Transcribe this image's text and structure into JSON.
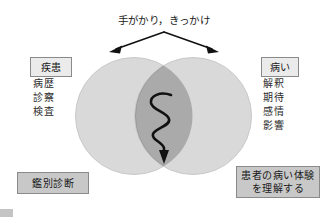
{
  "diagram": {
    "top_caption": "手がかり，きっかけ",
    "left": {
      "heading": "疾患",
      "items": [
        "病歴",
        "診察",
        "検査"
      ],
      "conclusion": "鑑別診断"
    },
    "right": {
      "heading": "病い",
      "items": [
        "解釈",
        "期待",
        "感情",
        "影響"
      ],
      "conclusion_line1": "患者の病い体験",
      "conclusion_line2": "を理解する"
    },
    "icons": {
      "left_arrow": "arrow-down-left-icon",
      "right_arrow": "arrow-down-right-icon",
      "squiggle_arrow": "squiggly-down-arrow-icon",
      "left_circle": "venn-circle-left-icon",
      "right_circle": "venn-circle-right-icon",
      "overlap": "venn-overlap-lens-icon"
    },
    "colors": {
      "circle_fill": "#d9d9d9",
      "overlap_fill": "#aaaaaa",
      "circle_stroke": "#c9c9c9",
      "box_fill": "#c8c8c8",
      "label_fill": "#ebebeb",
      "box_stroke": "#8a8a8a",
      "arrow": "#111111",
      "text": "#1a1a1a",
      "background": "#ffffff"
    }
  }
}
